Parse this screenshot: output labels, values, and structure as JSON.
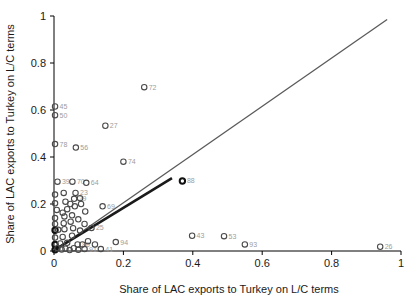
{
  "chart_data": {
    "type": "scatter",
    "title": "",
    "xlabel": "Share of LAC exports to Turkey on L/C terms",
    "ylabel": "Share of LAC exports to Turkey on L/C terms",
    "xlim": [
      0,
      1
    ],
    "ylim": [
      0,
      1
    ],
    "grid": false,
    "legend": "none",
    "x_ticks": [
      {
        "value": 0,
        "label": "0"
      },
      {
        "value": 0.2,
        "label": "0.2"
      },
      {
        "value": 0.4,
        "label": "0.4"
      },
      {
        "value": 0.6,
        "label": "0.6"
      },
      {
        "value": 0.8,
        "label": "0.8"
      },
      {
        "value": 1,
        "label": "1"
      }
    ],
    "y_ticks": [
      {
        "value": 0,
        "label": "0"
      },
      {
        "value": 0.2,
        "label": "0.2"
      },
      {
        "value": 0.4,
        "label": "0.4"
      },
      {
        "value": 0.6,
        "label": "0.6"
      },
      {
        "value": 0.8,
        "label": "0.8"
      },
      {
        "value": 1,
        "label": "1"
      }
    ],
    "reference_line": {
      "x1": 0,
      "y1": 0,
      "x2": 0.96,
      "y2": 0.985,
      "color": "#5a5a5a",
      "width": 1.3
    },
    "fit_line": {
      "x1": 0.002,
      "y1": 0.005,
      "x2": 0.34,
      "y2": 0.31,
      "color": "#1a1a1a",
      "width": 2.6
    },
    "point_style": {
      "stroke": "#4a4a4a",
      "stroke_bold": "#111111",
      "radius": 2.7,
      "fill": "none",
      "label_color": "#9d9d9d"
    },
    "points": [
      {
        "label": "45",
        "x": 0.003,
        "y": 0.615
      },
      {
        "label": "50",
        "x": 0.003,
        "y": 0.578
      },
      {
        "label": "78",
        "x": 0.003,
        "y": 0.455
      },
      {
        "label": "56",
        "x": 0.063,
        "y": 0.44
      },
      {
        "label": "27",
        "x": 0.148,
        "y": 0.533
      },
      {
        "label": "72",
        "x": 0.26,
        "y": 0.697
      },
      {
        "label": "74",
        "x": 0.2,
        "y": 0.38
      },
      {
        "label": "39",
        "x": 0.01,
        "y": 0.295
      },
      {
        "label": "70",
        "x": 0.053,
        "y": 0.295
      },
      {
        "label": "64",
        "x": 0.093,
        "y": 0.29
      },
      {
        "label": "88",
        "x": 0.37,
        "y": 0.298,
        "b": true
      },
      {
        "label": "23",
        "x": 0.062,
        "y": 0.247
      },
      {
        "label": "29",
        "x": 0.058,
        "y": 0.222
      },
      {
        "label": "69",
        "x": 0.14,
        "y": 0.19
      },
      {
        "label": "25",
        "x": 0.108,
        "y": 0.098
      },
      {
        "label": "43",
        "x": 0.398,
        "y": 0.065
      },
      {
        "label": "53",
        "x": 0.49,
        "y": 0.063
      },
      {
        "label": "93",
        "x": 0.55,
        "y": 0.028
      },
      {
        "label": "26",
        "x": 0.94,
        "y": 0.018
      },
      {
        "label": "94",
        "x": 0.178,
        "y": 0.038
      },
      {
        "label": "86",
        "x": 0.068,
        "y": 0.028
      },
      {
        "label": "91",
        "x": 0.088,
        "y": 0.008
      },
      {
        "label": "41",
        "x": 0.135,
        "y": 0.008
      },
      {
        "label": "",
        "x": 0.003,
        "y": 0.24
      },
      {
        "label": "",
        "x": 0.028,
        "y": 0.247
      },
      {
        "label": "",
        "x": 0.003,
        "y": 0.203
      },
      {
        "label": "",
        "x": 0.033,
        "y": 0.21
      },
      {
        "label": "",
        "x": 0.047,
        "y": 0.2
      },
      {
        "label": "",
        "x": 0.008,
        "y": 0.175
      },
      {
        "label": "",
        "x": 0.038,
        "y": 0.178
      },
      {
        "label": "",
        "x": 0.025,
        "y": 0.163
      },
      {
        "label": "",
        "x": 0.003,
        "y": 0.14
      },
      {
        "label": "",
        "x": 0.03,
        "y": 0.147
      },
      {
        "label": "",
        "x": 0.052,
        "y": 0.152
      },
      {
        "label": "",
        "x": 0.07,
        "y": 0.135
      },
      {
        "label": "",
        "x": 0.003,
        "y": 0.115
      },
      {
        "label": "",
        "x": 0.028,
        "y": 0.118
      },
      {
        "label": "",
        "x": 0.048,
        "y": 0.125
      },
      {
        "label": "",
        "x": 0.088,
        "y": 0.115
      },
      {
        "label": "",
        "x": 0.003,
        "y": 0.088,
        "b": true
      },
      {
        "label": "",
        "x": 0.012,
        "y": 0.09
      },
      {
        "label": "",
        "x": 0.03,
        "y": 0.093
      },
      {
        "label": "",
        "x": 0.055,
        "y": 0.097
      },
      {
        "label": "",
        "x": 0.075,
        "y": 0.087
      },
      {
        "label": "",
        "x": 0.003,
        "y": 0.057
      },
      {
        "label": "",
        "x": 0.025,
        "y": 0.06
      },
      {
        "label": "",
        "x": 0.052,
        "y": 0.065
      },
      {
        "label": "",
        "x": 0.003,
        "y": 0.028,
        "b": true
      },
      {
        "label": "",
        "x": 0.018,
        "y": 0.032
      },
      {
        "label": "",
        "x": 0.038,
        "y": 0.035
      },
      {
        "label": "",
        "x": 0.098,
        "y": 0.042
      },
      {
        "label": "",
        "x": 0.118,
        "y": 0.028
      },
      {
        "label": "",
        "x": 0.003,
        "y": 0.005,
        "b": true
      },
      {
        "label": "",
        "x": 0.01,
        "y": 0.012
      },
      {
        "label": "",
        "x": 0.022,
        "y": 0.006
      },
      {
        "label": "",
        "x": 0.033,
        "y": 0.01
      },
      {
        "label": "",
        "x": 0.045,
        "y": 0.004
      },
      {
        "label": "",
        "x": 0.057,
        "y": 0.012
      },
      {
        "label": "",
        "x": 0.07,
        "y": 0.005
      },
      {
        "label": "",
        "x": 0.082,
        "y": 0.028
      },
      {
        "label": "",
        "x": 0.06,
        "y": 0.19
      },
      {
        "label": "",
        "x": 0.078,
        "y": 0.2
      },
      {
        "label": "",
        "x": 0.09,
        "y": 0.168
      },
      {
        "label": "",
        "x": 0.075,
        "y": 0.225
      }
    ]
  }
}
